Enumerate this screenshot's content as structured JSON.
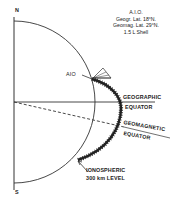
{
  "diagram": {
    "poles": {
      "north": "N",
      "south": "S"
    },
    "info_block": {
      "lines": [
        "A.I.O.",
        "Geogr. Lat. 18°N.",
        "Geomag. Lat. 29°N.",
        "1.5 L Shell"
      ]
    },
    "labels": {
      "station": "AIO",
      "geographic_equator_line1": "GEOGRAPHIC",
      "geographic_equator_line2": "EQUATOR",
      "geomagnetic_equator_line1": "GEOMAGNETIC",
      "geomagnetic_equator_line2": "EQUATOR",
      "ionospheric_line1": "IONOSPHERIC",
      "ionospheric_line2": "300 km LEVEL"
    },
    "colors": {
      "ink": "#222222",
      "background": "#ffffff"
    }
  }
}
